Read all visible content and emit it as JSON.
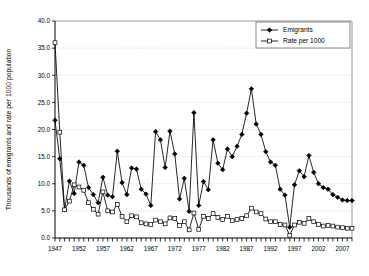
{
  "chart_data": {
    "type": "line",
    "title": "",
    "xlabel": "",
    "ylabel": "Thousands of emigrants and rate per 1000 population",
    "ylim": [
      0.0,
      40.0
    ],
    "xlim": [
      1947,
      2009
    ],
    "ytick_labels": [
      "0.0",
      "5.0",
      "10.0",
      "15.0",
      "20.0",
      "25.0",
      "30.0",
      "35.0",
      "40.0"
    ],
    "ytick_values": [
      0.0,
      5.0,
      10.0,
      15.0,
      20.0,
      25.0,
      30.0,
      35.0,
      40.0
    ],
    "xtick_labels": [
      "1947",
      "1952",
      "1957",
      "1962",
      "1967",
      "1972",
      "1977",
      "1982",
      "1987",
      "1992",
      "1997",
      "2002",
      "2007"
    ],
    "xtick_values": [
      1947,
      1952,
      1957,
      1962,
      1967,
      1972,
      1977,
      1982,
      1987,
      1992,
      1997,
      2002,
      2007
    ],
    "grid": "horizontal-dotted",
    "legend_position": "top-right",
    "x": [
      1947,
      1948,
      1949,
      1950,
      1951,
      1952,
      1953,
      1954,
      1955,
      1956,
      1957,
      1958,
      1959,
      1960,
      1961,
      1962,
      1963,
      1964,
      1965,
      1966,
      1967,
      1968,
      1969,
      1970,
      1971,
      1972,
      1973,
      1974,
      1975,
      1976,
      1977,
      1978,
      1979,
      1980,
      1981,
      1982,
      1983,
      1984,
      1985,
      1986,
      1987,
      1988,
      1989,
      1990,
      1991,
      1992,
      1993,
      1994,
      1995,
      1996,
      1997,
      1998,
      1999,
      2000,
      2001,
      2002,
      2003,
      2004,
      2005,
      2006,
      2007,
      2008,
      2009
    ],
    "series": [
      {
        "name": "Emigrants",
        "marker": "filled-diamond",
        "values": [
          21.7,
          14.6,
          5.2,
          10.5,
          8.2,
          14.0,
          13.4,
          9.3,
          8.0,
          6.5,
          11.2,
          7.9,
          7.6,
          16.0,
          10.2,
          8.0,
          12.9,
          12.7,
          9.0,
          8.1,
          6.0,
          19.6,
          18.1,
          13.0,
          19.7,
          15.5,
          7.2,
          11.0,
          4.9,
          23.1,
          6.0,
          10.4,
          8.9,
          18.1,
          13.8,
          12.6,
          16.4,
          15.0,
          16.9,
          19.1,
          23.0,
          27.5,
          21.0,
          19.1,
          15.9,
          14.0,
          13.4,
          9.0,
          7.9,
          2.0,
          9.8,
          12.4,
          11.3,
          15.2,
          12.1,
          10.0,
          9.3,
          9.0,
          8.0,
          7.5,
          7.0,
          6.9,
          6.9
        ]
      },
      {
        "name": "Rate per 1000",
        "marker": "open-square",
        "values": [
          36.0,
          19.5,
          5.2,
          6.8,
          9.8,
          9.4,
          8.8,
          6.5,
          5.3,
          4.4,
          8.5,
          5.0,
          4.8,
          6.2,
          4.0,
          3.0,
          4.1,
          3.9,
          2.8,
          2.6,
          2.5,
          3.3,
          3.0,
          2.6,
          3.7,
          3.6,
          2.3,
          3.0,
          1.5,
          4.6,
          1.6,
          4.0,
          3.6,
          4.5,
          3.8,
          3.4,
          4.0,
          3.2,
          3.4,
          3.6,
          4.1,
          5.5,
          4.8,
          4.5,
          3.5,
          3.0,
          3.0,
          2.5,
          2.4,
          0.5,
          2.4,
          2.9,
          2.7,
          3.6,
          3.0,
          2.5,
          2.2,
          2.3,
          2.2,
          2.0,
          1.9,
          1.8,
          1.8
        ]
      }
    ]
  },
  "legend": {
    "items": [
      {
        "label": "Emigrants"
      },
      {
        "label": "Rate per 1000"
      }
    ]
  },
  "colors": {
    "line": "#000000",
    "grid": "#c9c9c9",
    "frame": "#808080",
    "background": "#ffffff"
  }
}
